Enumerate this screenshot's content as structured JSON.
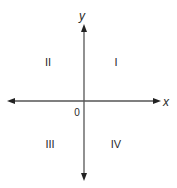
{
  "diagram": {
    "colors": {
      "axis": "#555555",
      "text": "#2a2a2a",
      "background": "#ffffff"
    },
    "axes": {
      "x_label": "x",
      "y_label": "y",
      "origin_label": "0"
    },
    "quadrants": [
      {
        "id": "I",
        "label": "I"
      },
      {
        "id": "II",
        "label": "II"
      },
      {
        "id": "III",
        "label": "III"
      },
      {
        "id": "IV",
        "label": "IV"
      }
    ]
  }
}
